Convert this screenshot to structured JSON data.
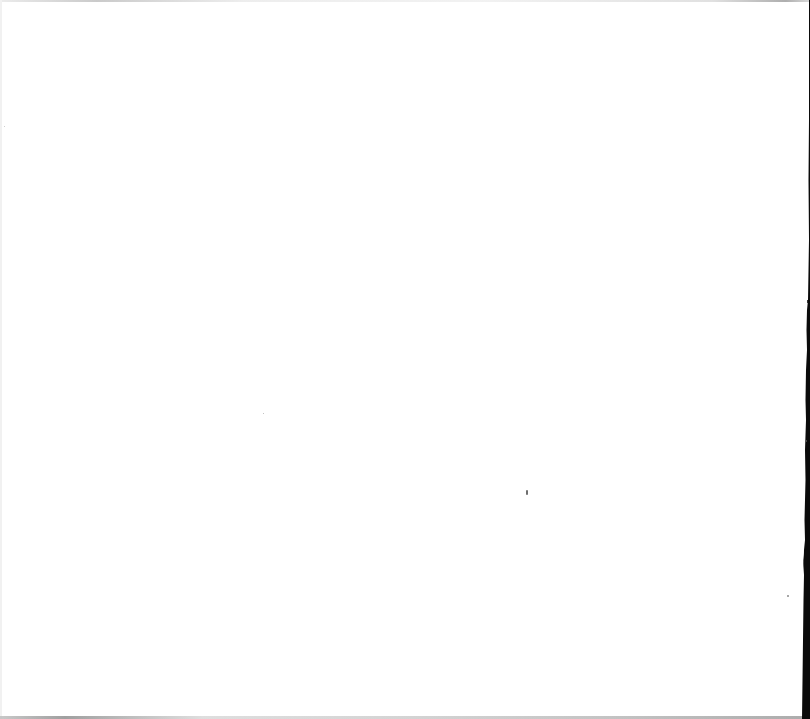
{
  "document": {
    "type": "blank-scanned-page",
    "text_content": "",
    "colors": {
      "paper": "#ffffff",
      "scanner_shadow": "#0a0a0a",
      "edge_gray": "#bdbdbd",
      "speck": "#6e6e6e"
    }
  }
}
